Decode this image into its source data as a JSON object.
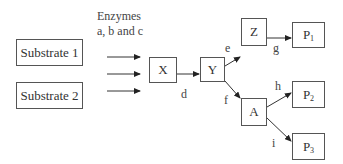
{
  "diagram": {
    "enzymes_label_line1": "Enzymes",
    "enzymes_label_line2": "a, b and c",
    "nodes": {
      "substrate1": "Substrate 1",
      "substrate2": "Substrate 2",
      "x": "X",
      "y": "Y",
      "z": "Z",
      "a": "A",
      "p1": "P",
      "p1_sub": "1",
      "p2": "P",
      "p2_sub": "2",
      "p3": "P",
      "p3_sub": "3"
    },
    "edges": {
      "d": "d",
      "e": "e",
      "f": "f",
      "g": "g",
      "h": "h",
      "i": "i"
    }
  }
}
